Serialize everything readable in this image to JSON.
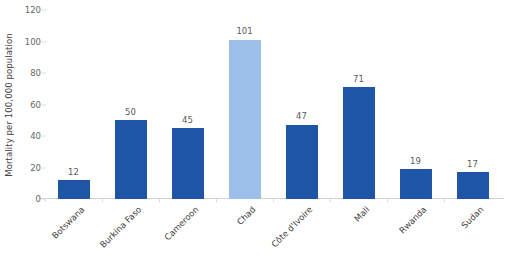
{
  "chart_data": {
    "type": "bar",
    "title": "",
    "subtitle": "",
    "xlabel": "",
    "ylabel": "Mortality per 100,000 population",
    "ylim": [
      0,
      120
    ],
    "ytick_labels": [
      "120",
      "100",
      "80",
      "60",
      "40",
      "20",
      "0"
    ],
    "ytick_values": [
      120,
      100,
      80,
      60,
      40,
      20,
      0
    ],
    "grid": false,
    "legend": "none",
    "categories": [
      "Botswana",
      "Burkina Faso",
      "Cameroon",
      "Chad",
      "Côte d'Ivoire",
      "Mali",
      "Rwanda",
      "Sudan"
    ],
    "values": [
      12,
      45,
      45,
      101,
      47,
      71,
      19,
      17
    ],
    "bar_values_display": [
      "12",
      "50",
      "45",
      "101",
      "47",
      "71",
      "19",
      "17"
    ],
    "data_values": [
      12,
      50,
      45,
      101,
      47,
      71,
      19,
      17
    ],
    "bar_colors": [
      "#1F55A5",
      "#1F55A5",
      "#1F55A5",
      "#9CC0EA",
      "#1F55A5",
      "#1F55A5",
      "#1F55A5",
      "#1F55A5"
    ],
    "highlight_category": "Chad",
    "highlight_color": "#9CC0EA",
    "series_color": "#1F55A5",
    "axis_color": "#D4D4D4",
    "text_color": "#595959",
    "background": "#FFFFFF"
  }
}
